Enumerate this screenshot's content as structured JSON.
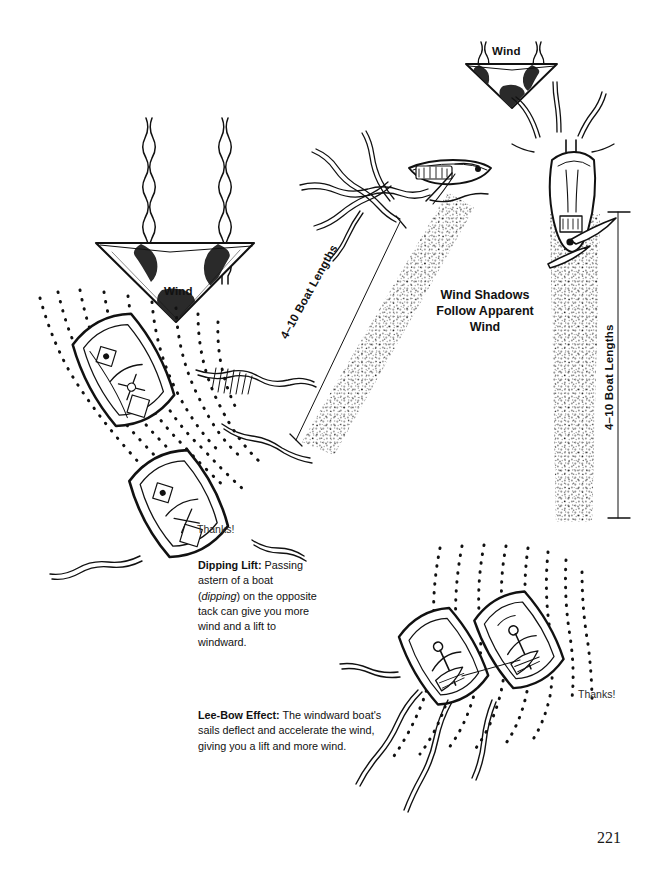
{
  "page": {
    "number": "221",
    "background": "#ffffff",
    "ink": "#111111"
  },
  "labels": {
    "wind_left": "Wind",
    "wind_top": "Wind",
    "center_note_line1": "Wind Shadows",
    "center_note_line2": "Follow Apparent",
    "center_note_line3": "Wind",
    "boat_lengths_left": "4–10 Boat Lengths",
    "boat_lengths_right": "4–10 Boat Lengths",
    "thanks_left": "Thanks!",
    "thanks_right": "Thanks!"
  },
  "captions": {
    "dipping": {
      "title": "Dipping Lift:",
      "body_a": "Passing astern of a boat (",
      "emph": "dipping",
      "body_b": ") on the opposite tack can give you more wind and a lift to windward."
    },
    "lee_bow": {
      "title": "Lee-Bow Effect:",
      "body": "The windward boat's sails deflect and accelerate the wind, giving you a lift and more wind."
    }
  },
  "figures": {
    "wind_arrow_left": "wind-arrow-down",
    "wind_arrow_top": "wind-arrow-down-small",
    "boat_upper_middle": "sailboat-with-wind-shadow-diagonal",
    "boat_upper_right": "sailboat-with-wind-shadow-vertical",
    "boats_dipping": "two-sailboats-dipping-lift",
    "boats_lee_bow": "two-sailboats-lee-bow-effect"
  }
}
